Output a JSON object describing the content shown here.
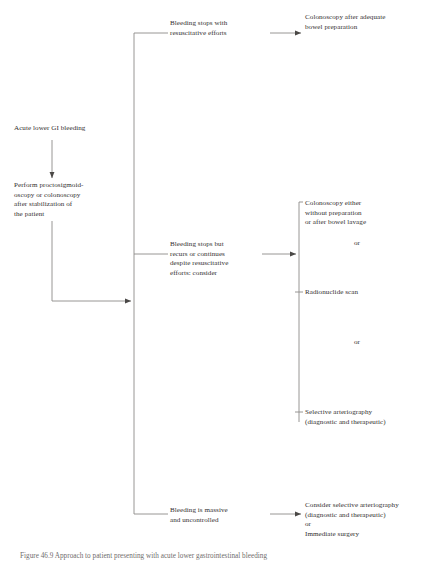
{
  "diagram": {
    "nodes": {
      "start": "Acute lower GI bleeding",
      "perform": "Perform proctosigmoid-\noscopy or colonoscopy\nafter stabilization of\nthe patient",
      "branch1_condition": "Bleeding stops with\nresuscitative efforts",
      "branch1_result": "Colonoscopy after adequate\nbowel preparation",
      "branch2_condition": "Bleeding stops but\nrecurs or continues\ndespite resuscitative\nefforts: consider",
      "branch2_option1": "Colonoscopy either\nwithout preparation\nor after bowel lavage",
      "branch2_option2": "Radionuclide scan",
      "branch2_option3": "Selective arteriography\n(diagnostic and therapeutic)",
      "branch3_condition": "Bleeding is massive\nand uncontrolled",
      "branch3_result": "Consider selective arteriography\n(diagnostic and therapeutic)\nor\nImmediate surgery"
    },
    "connectors": {
      "or_1": "or",
      "or_2": "or"
    },
    "caption": "Figure 46.9 Approach to patient presenting with acute lower gastrointestinal bleeding"
  },
  "colors": {
    "line": "#8d8b89",
    "text": "#33302f",
    "caption": "#6f6d6c",
    "background": "#ffffff"
  }
}
